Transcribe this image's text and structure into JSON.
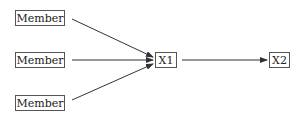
{
  "diagram": {
    "nodes": [
      {
        "id": "m1",
        "label": "Member"
      },
      {
        "id": "m2",
        "label": "Member"
      },
      {
        "id": "m3",
        "label": "Member"
      },
      {
        "id": "x1",
        "label": "X1"
      },
      {
        "id": "x2",
        "label": "X2"
      }
    ],
    "edges": [
      {
        "from": "m1",
        "to": "x1"
      },
      {
        "from": "m2",
        "to": "x1"
      },
      {
        "from": "m3",
        "to": "x1"
      },
      {
        "from": "x1",
        "to": "x2"
      }
    ],
    "colors": {
      "line": "#333333",
      "border": "#555555",
      "text": "#222222",
      "background": "#ffffff"
    }
  }
}
